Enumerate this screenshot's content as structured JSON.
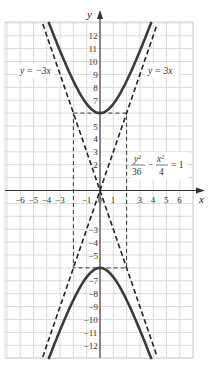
{
  "chart_data": {
    "type": "line",
    "title": "",
    "xlabel": "x",
    "ylabel": "y",
    "xlim": [
      -7,
      7
    ],
    "ylim": [
      -12.8,
      12.8
    ],
    "grid": true,
    "x_ticks": [
      -6,
      -5,
      -4,
      -3,
      -1,
      0,
      1,
      3,
      4,
      5,
      6
    ],
    "x_tick_labels": [
      "−6",
      "−5",
      "−4",
      "−3",
      "−1",
      "0",
      "1",
      "3",
      "4",
      "5",
      "6"
    ],
    "y_ticks": [
      12,
      11,
      10,
      9,
      8,
      7,
      5,
      4,
      3,
      2,
      -3,
      -4,
      -5,
      -7,
      -8,
      -9,
      -10,
      -11,
      -12
    ],
    "y_tick_labels": [
      "12",
      "11",
      "10",
      "9",
      "8",
      "7",
      "5",
      "4",
      "3",
      "2",
      "−3",
      "−4",
      "−5",
      "−7",
      "−8",
      "−9",
      "−10",
      "−11",
      "−12"
    ],
    "series": [
      {
        "name": "y²/36 − x²/4 = 1",
        "style": "solid",
        "branch": "upper",
        "equation": "y = 6*sqrt(1 + x^2/4)",
        "points": [
          [
            -3.84,
            12.9
          ],
          [
            -3,
            10.82
          ],
          [
            -2,
            8.49
          ],
          [
            -1,
            6.71
          ],
          [
            0,
            6
          ],
          [
            1,
            6.71
          ],
          [
            2,
            8.49
          ],
          [
            3,
            10.82
          ],
          [
            3.84,
            12.9
          ]
        ]
      },
      {
        "name": "y²/36 − x²/4 = 1",
        "style": "solid",
        "branch": "lower",
        "equation": "y = -6*sqrt(1 + x^2/4)",
        "points": [
          [
            -3.84,
            -12.9
          ],
          [
            -3,
            -10.82
          ],
          [
            -2,
            -8.49
          ],
          [
            -1,
            -6.71
          ],
          [
            0,
            -6
          ],
          [
            1,
            -6.71
          ],
          [
            2,
            -8.49
          ],
          [
            3,
            -10.82
          ],
          [
            3.84,
            -12.9
          ]
        ]
      },
      {
        "name": "y = 3x",
        "style": "dashed",
        "points": [
          [
            -4.3,
            -12.9
          ],
          [
            4.3,
            12.9
          ]
        ]
      },
      {
        "name": "y = −3x",
        "style": "dashed",
        "points": [
          [
            -4.3,
            12.9
          ],
          [
            4.3,
            -12.9
          ]
        ]
      },
      {
        "name": "fundamental rectangle",
        "style": "dashed",
        "points": [
          [
            -2,
            6
          ],
          [
            2,
            6
          ],
          [
            2,
            -6
          ],
          [
            -2,
            -6
          ],
          [
            -2,
            6
          ]
        ]
      }
    ],
    "annotations": [
      {
        "text": "y = −3x",
        "x": -5.2,
        "y": 9
      },
      {
        "text": "y = 3x",
        "x": 5.4,
        "y": 9
      },
      {
        "text": "y²/36 − x²/4 = 1",
        "x": 4.6,
        "y": 2
      }
    ]
  },
  "labels": {
    "x_axis": "x",
    "y_axis": "y",
    "asymptote_neg": "y = −3x",
    "asymptote_pos": "y = 3x",
    "eq_num1": "y",
    "eq_sup1": "2",
    "eq_den1": "36",
    "eq_minus": "−",
    "eq_num2": "x",
    "eq_sup2": "2",
    "eq_den2": "4",
    "eq_rhs": "= 1"
  },
  "colors": {
    "grid": "#cfcfcf",
    "axis": "#333333",
    "curve": "#3a3a3a",
    "dashed": "#222222"
  }
}
